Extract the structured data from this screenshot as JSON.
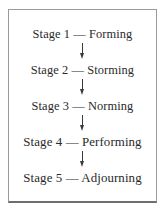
{
  "diagram": {
    "type": "vertical-flowchart",
    "border_color": "#9a9a9a",
    "text_color": "#2a2a2a",
    "background_color": "#ffffff",
    "steps": [
      {
        "label": "Stage 1 — Forming"
      },
      {
        "label": "Stage 2 — Storming"
      },
      {
        "label": "Stage 3 — Norming"
      },
      {
        "label": "Stage 4 — Performing"
      },
      {
        "label": "Stage 5 — Adjourning"
      }
    ],
    "connectors": [
      {
        "name": "arrow-down",
        "from": "Stage 1 — Forming",
        "to": "Stage 2 — Storming"
      },
      {
        "name": "arrow-down",
        "from": "Stage 2 — Storming",
        "to": "Stage 3 — Norming"
      },
      {
        "name": "arrow-down",
        "from": "Stage 3 — Norming",
        "to": "Stage 4 — Performing"
      },
      {
        "name": "arrow-down",
        "from": "Stage 4 — Performing",
        "to": "Stage 5 — Adjourning"
      }
    ]
  }
}
